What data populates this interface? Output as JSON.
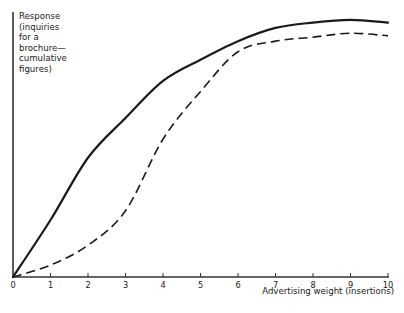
{
  "chart_data": {
    "type": "line",
    "title": "",
    "xlabel": "Advertising weight (insertions)",
    "ylabel": "Response (inquiries for a brochure—cumulative figures)",
    "ylabel_lines": [
      "Response",
      "(inquiries",
      "for a",
      "brochure—",
      "cumulative",
      "figures)"
    ],
    "x": [
      0,
      1,
      2,
      3,
      4,
      5,
      6,
      7,
      8,
      9,
      10
    ],
    "x_tick_labels": [
      "0",
      "1",
      "2",
      "3",
      "4",
      "5",
      "6",
      "7",
      "8",
      "9",
      "10"
    ],
    "xlim": [
      0,
      10
    ],
    "ylim": [
      0,
      100
    ],
    "y_ticks": [],
    "grid": false,
    "legend": null,
    "series": [
      {
        "name": "solid curve",
        "style": "solid",
        "color": "#1a1a1a",
        "values": [
          0,
          21.5,
          45,
          60,
          74,
          82,
          89,
          94,
          96,
          97,
          96
        ]
      },
      {
        "name": "dashed curve",
        "style": "dashed",
        "color": "#1a1a1a",
        "values": [
          0,
          4.5,
          12,
          25,
          52,
          70,
          85,
          89,
          90.5,
          92,
          91
        ]
      }
    ]
  },
  "axes": {
    "x_title": "Advertising weight (insertions)",
    "y_title_lines": [
      "Response",
      "(inquiries",
      "for a",
      "brochure—",
      "cumulative",
      "figures)"
    ]
  }
}
